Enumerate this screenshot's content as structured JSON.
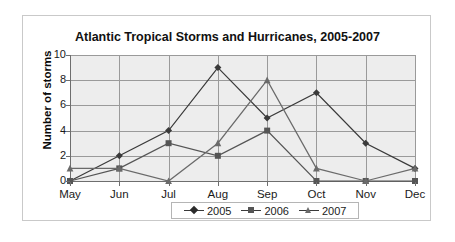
{
  "chart_data": {
    "type": "line",
    "title": "Atlantic Tropical Storms and Hurricanes, 2005-2007",
    "xlabel": "",
    "ylabel": "Number of storms",
    "categories": [
      "May",
      "Jun",
      "Jul",
      "Aug",
      "Sep",
      "Oct",
      "Nov",
      "Dec"
    ],
    "yticks": [
      0,
      2,
      4,
      6,
      8,
      10
    ],
    "ylim": [
      0,
      10
    ],
    "grid": true,
    "legend_position": "bottom-center",
    "series": [
      {
        "name": "2005",
        "marker": "diamond",
        "color": "#3a3a3a",
        "values": [
          0,
          2,
          4,
          9,
          5,
          7,
          3,
          1
        ]
      },
      {
        "name": "2006",
        "marker": "square",
        "color": "#555555",
        "values": [
          0,
          1,
          3,
          2,
          4,
          0,
          0,
          0
        ]
      },
      {
        "name": "2007",
        "marker": "triangle",
        "color": "#6a6a6a",
        "values": [
          1,
          1,
          0,
          3,
          8,
          1,
          0,
          1
        ]
      }
    ]
  },
  "legend": {
    "items": [
      {
        "label": "2005"
      },
      {
        "label": "2006"
      },
      {
        "label": "2007"
      }
    ]
  }
}
